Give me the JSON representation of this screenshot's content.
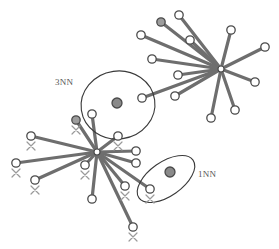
{
  "figure": {
    "type": "node-link-diagram",
    "title": "",
    "width": 279,
    "height": 249,
    "background": "#ffffff"
  },
  "style": {
    "edge_color": "#6e6e6e",
    "edge_width": 3.2,
    "node_stroke": "#4a4a4a",
    "node_fill": "#ffffff",
    "node_radius": 4.2,
    "node_stroke_width": 1.3,
    "hub_fill": "#8a8a8a",
    "hub_radius": 5.0,
    "group_stroke": "#3a3a3a",
    "group_stroke_width": 1.1,
    "cross_color": "#9a9a9a",
    "cross_size": 4.0,
    "label_color": "#555555"
  },
  "labels": [
    {
      "name": "label-3nn",
      "text": "3NN",
      "x": 55,
      "y": 77
    },
    {
      "name": "label-1nn",
      "text": "1NN",
      "x": 198,
      "y": 169
    }
  ],
  "groups": [
    {
      "name": "group-3nn",
      "shape": "circle",
      "cx": 118,
      "cy": 105,
      "rx": 37,
      "ry": 34,
      "rotate": -8,
      "member_count": 3,
      "centroid": {
        "x": 117,
        "y": 103
      }
    },
    {
      "name": "group-1nn",
      "shape": "ellipse",
      "cx": 166,
      "cy": 179,
      "rx": 33,
      "ry": 17,
      "rotate": -35,
      "member_count": 1,
      "centroid": {
        "x": 170,
        "y": 172
      }
    }
  ],
  "stars": [
    {
      "name": "star-upper-right",
      "hub": {
        "x": 221,
        "y": 69,
        "filled": false
      },
      "spokes": [
        {
          "x": 179,
          "y": 15,
          "cross": false,
          "shaded": false
        },
        {
          "x": 161,
          "y": 22,
          "cross": false,
          "shaded": true
        },
        {
          "x": 190,
          "y": 40,
          "cross": false,
          "shaded": false
        },
        {
          "x": 141,
          "y": 35,
          "cross": false,
          "shaded": false
        },
        {
          "x": 152,
          "y": 59,
          "cross": false,
          "shaded": false
        },
        {
          "x": 178,
          "y": 75,
          "cross": false,
          "shaded": false
        },
        {
          "x": 175,
          "y": 96,
          "cross": false,
          "shaded": false
        },
        {
          "x": 231,
          "y": 30,
          "cross": false,
          "shaded": false
        },
        {
          "x": 265,
          "y": 47,
          "cross": false,
          "shaded": false
        },
        {
          "x": 255,
          "y": 82,
          "cross": false,
          "shaded": false
        },
        {
          "x": 235,
          "y": 110,
          "cross": false,
          "shaded": false
        },
        {
          "x": 211,
          "y": 118,
          "cross": false,
          "shaded": false
        },
        {
          "x": 142,
          "y": 98,
          "cross": false,
          "shaded": false
        }
      ]
    },
    {
      "name": "star-lower-left",
      "hub": {
        "x": 97,
        "y": 152,
        "filled": false
      },
      "spokes": [
        {
          "x": 76,
          "y": 120,
          "cross": true,
          "shaded": true
        },
        {
          "x": 31,
          "y": 136,
          "cross": true,
          "shaded": false
        },
        {
          "x": 16,
          "y": 163,
          "cross": true,
          "shaded": false
        },
        {
          "x": 35,
          "y": 180,
          "cross": true,
          "shaded": false
        },
        {
          "x": 85,
          "y": 165,
          "cross": true,
          "shaded": false
        },
        {
          "x": 92,
          "y": 199,
          "cross": false,
          "shaded": false
        },
        {
          "x": 125,
          "y": 186,
          "cross": true,
          "shaded": false
        },
        {
          "x": 133,
          "y": 227,
          "cross": true,
          "shaded": false
        },
        {
          "x": 136,
          "y": 151,
          "cross": false,
          "shaded": false
        },
        {
          "x": 136,
          "y": 163,
          "cross": false,
          "shaded": false
        },
        {
          "x": 92,
          "y": 114,
          "cross": false,
          "shaded": false
        },
        {
          "x": 118,
          "y": 136,
          "cross": true,
          "shaded": false
        },
        {
          "x": 150,
          "y": 189,
          "cross": true,
          "shaded": false
        }
      ]
    }
  ],
  "extra_nodes": [
    {
      "name": "node-group-3nn-right",
      "x": 142,
      "y": 98,
      "cross": false
    },
    {
      "name": "node-group-3nn-left",
      "x": 92,
      "y": 114,
      "cross": false
    },
    {
      "name": "node-group-3nn-bottom",
      "x": 118,
      "y": 136,
      "cross": true
    },
    {
      "name": "node-group-1nn-member",
      "x": 150,
      "y": 189,
      "cross": true
    }
  ]
}
